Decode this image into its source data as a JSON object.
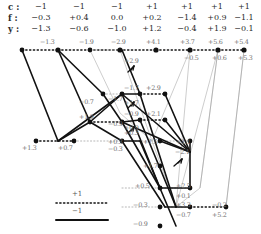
{
  "figure": {
    "type": "trellis-diagram",
    "title_visible": false,
    "width": 261,
    "height": 234
  },
  "header": {
    "row_labels": {
      "c": "c :",
      "f": "f :",
      "y": "y :"
    },
    "columns": [
      {
        "c": "−1",
        "f": "−0.3",
        "y": "−1.3"
      },
      {
        "c": "−1",
        "f": "+0.4",
        "y": "−0.6"
      },
      {
        "c": "−1",
        "f": "0.0",
        "y": "−1.0"
      },
      {
        "c": "+1",
        "f": "+0.2",
        "y": "+1.2"
      },
      {
        "c": "+1",
        "f": "−1.4",
        "y": "−0.4"
      },
      {
        "c": "+1",
        "f": "+0.9",
        "y": "+1.9"
      },
      {
        "c": "+1",
        "f": "−1.1",
        "y": "−0.1"
      }
    ]
  },
  "legend": {
    "dotted_label": "+1",
    "solid_label": "−1"
  },
  "colors": {
    "solid_edge": "#1a1a1a",
    "dotted_edge": "#1a1a1a",
    "faint_edge": "#9a9a9a",
    "node_fill": "#111111",
    "label_text": "#6f6f6f",
    "header_text": "#2b2b2b"
  },
  "node_labels": [
    {
      "text": "−1.3",
      "x": 46,
      "y": 44
    },
    {
      "text": "−1.9",
      "x": 85,
      "y": 44
    },
    {
      "text": "−2.9",
      "x": 124,
      "y": 44
    },
    {
      "text": "+4.1",
      "x": 158,
      "y": 44
    },
    {
      "text": "+3.7",
      "x": 192,
      "y": 44
    },
    {
      "text": "+5.6",
      "x": 220,
      "y": 44
    },
    {
      "text": "+5.4",
      "x": 245,
      "y": 44
    },
    {
      "text": "+2.9",
      "x": 130,
      "y": 63
    },
    {
      "text": "−0.5",
      "x": 196,
      "y": 57
    },
    {
      "text": "+0.6",
      "x": 222,
      "y": 57
    },
    {
      "text": "+5.3",
      "x": 247,
      "y": 57
    },
    {
      "text": "−0.7",
      "x": 87,
      "y": 101
    },
    {
      "text": "−1.7",
      "x": 128,
      "y": 88
    },
    {
      "text": "−1.7",
      "x": 115,
      "y": 97
    },
    {
      "text": "+1.7",
      "x": 128,
      "y": 101
    },
    {
      "text": "+2.9",
      "x": 158,
      "y": 88
    },
    {
      "text": "+1.9",
      "x": 87,
      "y": 117
    },
    {
      "text": "−0.9",
      "x": 128,
      "y": 113
    },
    {
      "text": "−0.9",
      "x": 115,
      "y": 122
    },
    {
      "text": "+0.9",
      "x": 128,
      "y": 126
    },
    {
      "text": "+2.1",
      "x": 158,
      "y": 113
    },
    {
      "text": "+1.3",
      "x": 26,
      "y": 147
    },
    {
      "text": "+0.7",
      "x": 63,
      "y": 147
    },
    {
      "text": "+0.3",
      "x": 128,
      "y": 132
    },
    {
      "text": "+0.3",
      "x": 115,
      "y": 141
    },
    {
      "text": "−0.3",
      "x": 118,
      "y": 147
    },
    {
      "text": "+1.5",
      "x": 152,
      "y": 141
    },
    {
      "text": "+1.1",
      "x": 187,
      "y": 141
    },
    {
      "text": "−2.1",
      "x": 185,
      "y": 152
    },
    {
      "text": "+1.7",
      "x": 152,
      "y": 166
    },
    {
      "text": "+0.5",
      "x": 144,
      "y": 185
    },
    {
      "text": "+2.5",
      "x": 186,
      "y": 185
    },
    {
      "text": "+0.1",
      "x": 186,
      "y": 195
    },
    {
      "text": "−0.3",
      "x": 143,
      "y": 205
    },
    {
      "text": "+3.3",
      "x": 186,
      "y": 205
    },
    {
      "text": "−0.7",
      "x": 186,
      "y": 215
    },
    {
      "text": "−0.2",
      "x": 222,
      "y": 205
    },
    {
      "text": "+5.2",
      "x": 222,
      "y": 215
    },
    {
      "text": "−0.9",
      "x": 143,
      "y": 224
    }
  ]
}
